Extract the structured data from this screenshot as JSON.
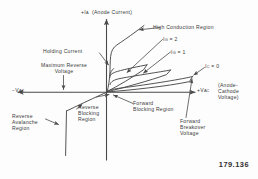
{
  "figure": {
    "number": "179.136",
    "type": "scr-thyristor-v-i-characteristic"
  },
  "axes": {
    "y_positive_prefix": "+",
    "y_positive_symbol": "I",
    "y_positive_subscript": "A",
    "y_positive_name": "(Anode Current)",
    "x_negative_prefix": "−",
    "x_negative_symbol": "V",
    "x_negative_subscript": "AC",
    "x_positive_prefix": "+",
    "x_positive_symbol": "V",
    "x_positive_subscript": "AC",
    "x_positive_name_line1": "(Anode-",
    "x_positive_name_line2": "Cathode",
    "x_positive_name_line3": "Voltage)"
  },
  "annotations": {
    "high_conduction": "High Conduction Region",
    "holding_current": "Holding Current",
    "max_reverse_voltage_line1": "Maximum Reverse",
    "max_reverse_voltage_line2": "Voltage",
    "reverse_avalanche_line1": "Reverse",
    "reverse_avalanche_line2": "Avalanche",
    "reverse_avalanche_line3": "Region",
    "reverse_blocking_line1": "Reverse",
    "reverse_blocking_line2": "Blocking",
    "reverse_blocking_line3": "Region",
    "forward_blocking_line1": "Forward",
    "forward_blocking_line2": "Blocking Region",
    "forward_breakover_line1": "Forward",
    "forward_breakover_line2": "Breakover",
    "forward_breakover_line3": "Voltage"
  },
  "curves": [
    {
      "symbol": "I",
      "subscript": "G",
      "equals": "=",
      "value": "2"
    },
    {
      "symbol": "I",
      "subscript": "G",
      "equals": "=",
      "value": "1"
    },
    {
      "symbol": "I",
      "subscript": "C",
      "equals": "=",
      "value": "0"
    }
  ],
  "colors": {
    "ink": "#3a3a3a",
    "line": "#4a4a4a",
    "background": "#fdfdfd"
  }
}
